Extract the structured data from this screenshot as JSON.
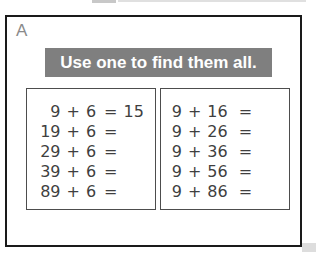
{
  "panel": {
    "label": "A",
    "banner_text": "Use one to find them all."
  },
  "boxes": [
    {
      "name": "left",
      "rows": [
        {
          "a": "9",
          "plus": "+",
          "b": "6",
          "eq": "=",
          "ans": "15"
        },
        {
          "a": "19",
          "plus": "+",
          "b": "6",
          "eq": "=",
          "ans": ""
        },
        {
          "a": "29",
          "plus": "+",
          "b": "6",
          "eq": "=",
          "ans": ""
        },
        {
          "a": "39",
          "plus": "+",
          "b": "6",
          "eq": "=",
          "ans": ""
        },
        {
          "a": "89",
          "plus": "+",
          "b": "6",
          "eq": "=",
          "ans": ""
        }
      ]
    },
    {
      "name": "right",
      "rows": [
        {
          "a": "9",
          "plus": "+",
          "b": "16",
          "eq": "=",
          "ans": ""
        },
        {
          "a": "9",
          "plus": "+",
          "b": "26",
          "eq": "=",
          "ans": ""
        },
        {
          "a": "9",
          "plus": "+",
          "b": "36",
          "eq": "=",
          "ans": ""
        },
        {
          "a": "9",
          "plus": "+",
          "b": "56",
          "eq": "=",
          "ans": ""
        },
        {
          "a": "9",
          "plus": "+",
          "b": "86",
          "eq": "=",
          "ans": ""
        }
      ]
    }
  ],
  "colors": {
    "banner_bg": "#7f7f7f",
    "banner_text": "#ffffff",
    "frame_border": "#1a1a1a",
    "box_border": "#4d4d4d",
    "equation_text": "#3f3f3f",
    "label_text": "#8a8a8a"
  }
}
